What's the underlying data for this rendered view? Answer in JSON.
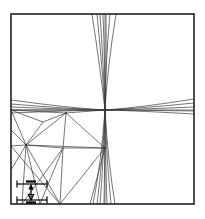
{
  "figure": {
    "title": "Finite element mesh with crossing refinement bands",
    "background_color": "#ffffff",
    "line_color": "#3a3a3a",
    "frame_color": "#222222",
    "annotation_color": "#000000"
  },
  "frame": {
    "name": "domain-boundary",
    "x": 11,
    "y": 14,
    "width": 183,
    "height": 190,
    "stroke_width": 1.6
  },
  "crossing_point": {
    "x": 105,
    "y": 110,
    "label": "band-intersection"
  },
  "vertical_band": {
    "name": "vertical-refinement-band",
    "pinch_x": 105,
    "pinch_y": 110,
    "top_y": 14,
    "bottom_y": 204,
    "top_spread": [
      92,
      97,
      100,
      103,
      106,
      110,
      116
    ],
    "bottom_spread": [
      93,
      97,
      100,
      104,
      107,
      111,
      115
    ],
    "waist_spread": [
      103.2,
      104.2,
      105,
      105.8,
      106.8
    ],
    "stroke_width": 0.7
  },
  "horizontal_band": {
    "name": "horizontal-refinement-band",
    "pinch_x": 105,
    "pinch_y": 110,
    "left_x": 11,
    "right_x": 194,
    "left_spread": [
      100,
      104,
      107,
      110,
      113
    ],
    "right_spread": [
      99,
      103,
      107,
      111,
      114
    ],
    "stroke_width": 0.7
  },
  "mesh": {
    "name": "triangular-mesh",
    "stroke_width": 0.7,
    "nodes": [
      {
        "id": "n0",
        "x": 11,
        "y": 110
      },
      {
        "id": "n1",
        "x": 11,
        "y": 130
      },
      {
        "id": "n2",
        "x": 11,
        "y": 146
      },
      {
        "id": "n3",
        "x": 11,
        "y": 170
      },
      {
        "id": "n4",
        "x": 11,
        "y": 186
      },
      {
        "id": "n5",
        "x": 11,
        "y": 204
      },
      {
        "id": "n6",
        "x": 26,
        "y": 145
      },
      {
        "id": "n7",
        "x": 43,
        "y": 122
      },
      {
        "id": "n8",
        "x": 66,
        "y": 113
      },
      {
        "id": "n9",
        "x": 63,
        "y": 148
      },
      {
        "id": "n10",
        "x": 105,
        "y": 148
      },
      {
        "id": "n11",
        "x": 105,
        "y": 110
      },
      {
        "id": "n12",
        "x": 60,
        "y": 204
      },
      {
        "id": "n13",
        "x": 90,
        "y": 204
      },
      {
        "id": "n14",
        "x": 40,
        "y": 204
      },
      {
        "id": "n15",
        "x": 22,
        "y": 204
      }
    ],
    "edges": [
      [
        "n0",
        "n6"
      ],
      [
        "n1",
        "n6"
      ],
      [
        "n2",
        "n6"
      ],
      [
        "n3",
        "n6"
      ],
      [
        "n6",
        "n7"
      ],
      [
        "n6",
        "n8"
      ],
      [
        "n6",
        "n9"
      ],
      [
        "n6",
        "n10"
      ],
      [
        "n7",
        "n8"
      ],
      [
        "n8",
        "n9"
      ],
      [
        "n8",
        "n10"
      ],
      [
        "n8",
        "n11"
      ],
      [
        "n9",
        "n10"
      ],
      [
        "n6",
        "n12"
      ],
      [
        "n6",
        "n14"
      ],
      [
        "n9",
        "n12"
      ],
      [
        "n9",
        "n14"
      ],
      [
        "n10",
        "n12"
      ],
      [
        "n10",
        "n13"
      ],
      [
        "n2",
        "n12"
      ],
      [
        "n6",
        "n15"
      ],
      [
        "n7",
        "n0"
      ],
      [
        "n8",
        "n0"
      ],
      [
        "n9",
        "n15"
      ]
    ]
  },
  "dimension_annotation": {
    "name": "dimension-arrow",
    "arrow_x": 31,
    "top_y": 184,
    "bottom_y": 200,
    "upper_extension": {
      "x1": 17,
      "x2": 47,
      "y": 184
    },
    "lower_extension": {
      "x1": 17,
      "x2": 47,
      "y": 200
    },
    "tick_half_len": 3.5,
    "label": "",
    "stroke_width": 1.2
  }
}
